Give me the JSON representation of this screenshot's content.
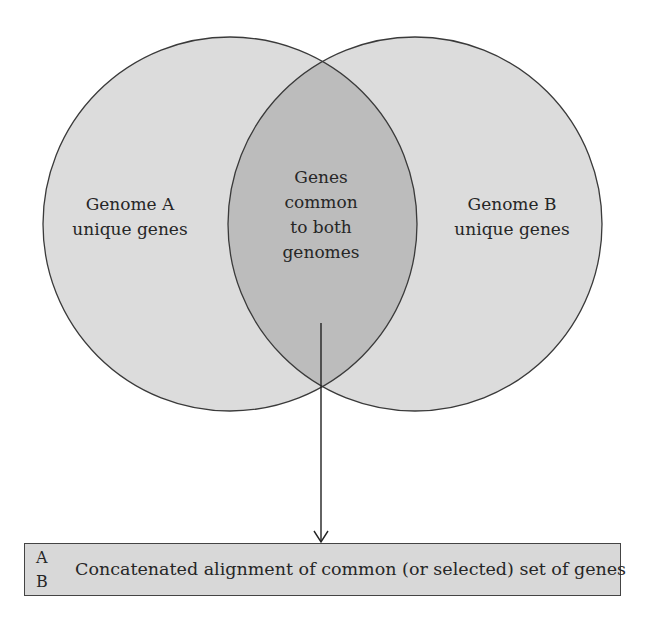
{
  "diagram": {
    "type": "venn",
    "colors": {
      "circle_fill": "#dcdcdc",
      "intersection_fill": "#bcbcbc",
      "outline": "#3a3a3a",
      "box_fill": "#d8d8d8"
    },
    "sets": [
      {
        "id": "A",
        "lines": [
          "Genome A",
          "unique genes"
        ]
      },
      {
        "id": "B",
        "lines": [
          "Genome B",
          "unique genes"
        ]
      }
    ],
    "intersection": {
      "lines": [
        "Genes",
        "common",
        "to both",
        "genomes"
      ]
    },
    "output_box": {
      "row_labels": [
        "A",
        "B"
      ],
      "text": "Concatenated alignment of common (or selected) set of genes"
    }
  }
}
